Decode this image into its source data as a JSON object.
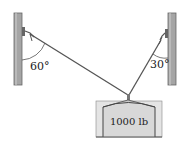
{
  "diagram": {
    "type": "statics-free-body",
    "left_angle_label": "60°",
    "right_angle_label": "30°",
    "weight_label": "1000 lb",
    "colors": {
      "wall": "#9a9a9a",
      "wall_edge": "#555555",
      "cable": "#555555",
      "box_fill": "#e6e6e6",
      "box_stroke": "#444444",
      "text": "#222222"
    }
  }
}
